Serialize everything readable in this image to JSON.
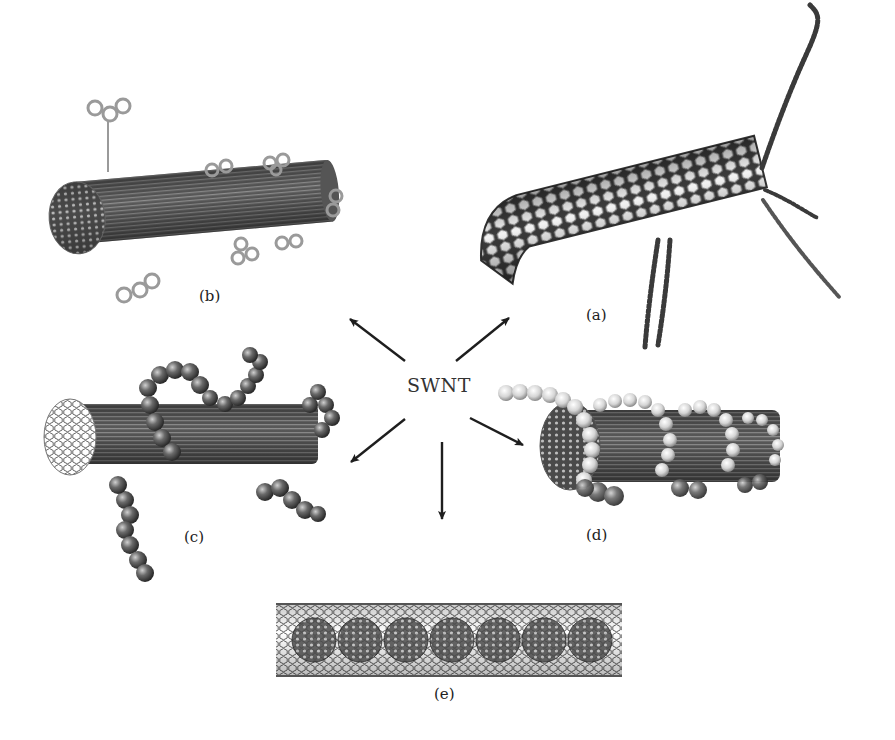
{
  "figure": {
    "center": {
      "label": "SWNT",
      "x": 408,
      "y": 384
    },
    "panels": [
      {
        "id": "a",
        "label": "(a)",
        "description": "SWNT with covalently attached polymer chains at the tube end and sidewall",
        "label_x": 586,
        "label_y": 308
      },
      {
        "id": "b",
        "label": "(b)",
        "description": "SWNT with sidewall-attached aromatic ring functional groups",
        "label_x": 199,
        "label_y": 287
      },
      {
        "id": "c",
        "label": "(c)",
        "description": "SWNT with non-covalently adsorbed polymer / biomolecule chains (space-filling)",
        "label_x": 184,
        "label_y": 536
      },
      {
        "id": "d",
        "label": "(d)",
        "description": "SWNT wrapped helically by a polymer chain (space-filling)",
        "label_x": 586,
        "label_y": 527
      },
      {
        "id": "e",
        "label": "(e)",
        "description": "SWNT with endohedrally encapsulated fullerenes (peapod)",
        "label_x": 434,
        "label_y": 692
      }
    ],
    "arrows": [
      {
        "to": "b",
        "x1": 405,
        "y1": 361,
        "x2": 348,
        "y2": 318
      },
      {
        "to": "a",
        "x1": 456,
        "y1": 361,
        "x2": 511,
        "y2": 317
      },
      {
        "to": "c",
        "x1": 405,
        "y1": 419,
        "x2": 349,
        "y2": 463
      },
      {
        "to": "d",
        "x1": 470,
        "y1": 418,
        "x2": 525,
        "y2": 446
      },
      {
        "to": "e",
        "x1": 442,
        "y1": 442,
        "x2": 442,
        "y2": 521
      }
    ],
    "colors": {
      "background": "#ffffff",
      "arrow": "#1e1e1e",
      "tube_dark": "#3a3a3a",
      "tube_mid": "#6e6e6e",
      "tube_light": "#d8d8d8",
      "sphere_light": "#e6e6e6",
      "text": "#222222"
    }
  }
}
